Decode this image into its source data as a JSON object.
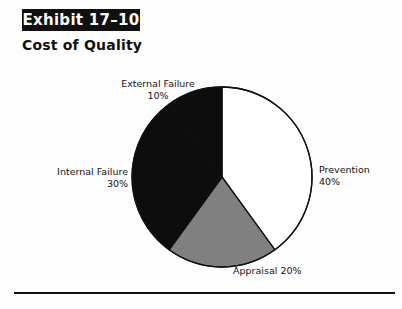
{
  "header": {
    "exhibit_label": "Exhibit 17–10",
    "subtitle": "Cost of Quality"
  },
  "chart_data": {
    "type": "pie",
    "title": "Cost of Quality",
    "exhibit": "Exhibit 17–10",
    "categories": [
      "Prevention",
      "Appraisal",
      "Internal Failure",
      "External Failure"
    ],
    "values": [
      40,
      20,
      30,
      10
    ],
    "unit": "%",
    "start_angle_deg": 0,
    "direction": "clockwise",
    "legend": "none",
    "grid": false,
    "slices": [
      {
        "name": "Prevention",
        "value": 40,
        "value_label": "40%",
        "color": "#ffffff",
        "stroke": "#111111",
        "label_position": "right"
      },
      {
        "name": "Appraisal",
        "value": 20,
        "value_label": "20%",
        "color": "#808080",
        "stroke": "#111111",
        "label_position": "bottom"
      },
      {
        "name": "Internal Failure",
        "value": 30,
        "value_label": "30%",
        "color": "#0d0d0d",
        "stroke": "#111111",
        "label_position": "left"
      },
      {
        "name": "External Failure",
        "value": 10,
        "value_label": "10%",
        "color": "#0d0d0d",
        "stroke": "#111111",
        "label_position": "top-left"
      }
    ]
  },
  "labels": {
    "external_failure": {
      "name": "External Failure",
      "value": "10%"
    },
    "prevention": {
      "name": "Prevention",
      "value": "40%"
    },
    "internal_failure": {
      "name": "Internal Failure",
      "value": "30%"
    },
    "appraisal": {
      "name": "Appraisal",
      "value": "20%"
    }
  },
  "colors": {
    "banner_bg": "#111111",
    "banner_text": "#ffffff",
    "slice_white": "#ffffff",
    "slice_gray": "#808080",
    "slice_black": "#0d0d0d",
    "outline": "#111111",
    "rule": "#111111"
  }
}
